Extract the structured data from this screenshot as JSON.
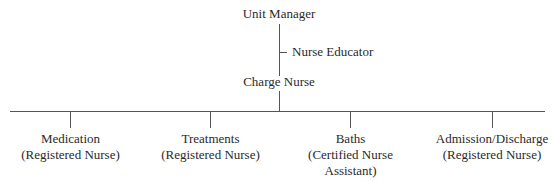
{
  "chart": {
    "top": {
      "title": "Unit Manager"
    },
    "staff": {
      "title": "Nurse Educator"
    },
    "middle": {
      "title": "Charge Nurse"
    },
    "children": [
      {
        "title": "Medication",
        "subtitle_lines": [
          "(Registered Nurse)"
        ]
      },
      {
        "title": "Treatments",
        "subtitle_lines": [
          "(Registered Nurse)"
        ]
      },
      {
        "title": "Baths",
        "subtitle_lines": [
          "(Certified Nurse",
          "Assistant)"
        ]
      },
      {
        "title": "Admission/Discharge",
        "subtitle_lines": [
          "(Registered Nurse)"
        ]
      }
    ]
  }
}
